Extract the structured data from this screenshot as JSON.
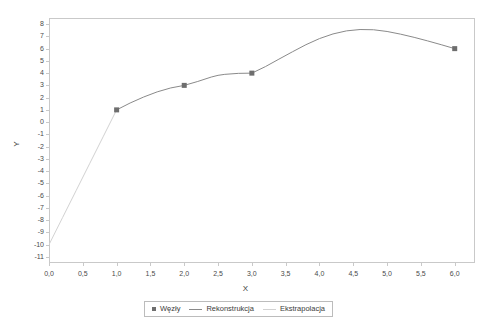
{
  "chart_data": {
    "type": "line",
    "title": "",
    "xlabel": "X",
    "ylabel": "Y",
    "xlim": [
      0.0,
      6.3
    ],
    "ylim": [
      -11.5,
      8.5
    ],
    "grid": false,
    "legend_position": "bottom",
    "xticks": [
      "0,0",
      "0,5",
      "1,0",
      "1,5",
      "2,0",
      "2,5",
      "3,0",
      "3,5",
      "4,0",
      "4,5",
      "5,0",
      "5,5",
      "6,0"
    ],
    "xtick_values": [
      0.0,
      0.5,
      1.0,
      1.5,
      2.0,
      2.5,
      3.0,
      3.5,
      4.0,
      4.5,
      5.0,
      5.5,
      6.0
    ],
    "yticks": [
      "8",
      "7",
      "6",
      "5",
      "4",
      "3",
      "2",
      "1",
      "0",
      "-1",
      "-2",
      "-3",
      "-4",
      "-5",
      "-6",
      "-7",
      "-8",
      "-9",
      "-10",
      "-11"
    ],
    "ytick_values": [
      8,
      7,
      6,
      5,
      4,
      3,
      2,
      1,
      0,
      -1,
      -2,
      -3,
      -4,
      -5,
      -6,
      -7,
      -8,
      -9,
      -10,
      -11
    ],
    "series": [
      {
        "name": "Węzły",
        "type": "scatter",
        "marker": "square",
        "color": "#6e6e6e",
        "x": [
          1.0,
          2.0,
          3.0,
          6.0
        ],
        "y": [
          1.0,
          3.0,
          4.0,
          6.0
        ]
      },
      {
        "name": "Rekonstrukcja",
        "type": "line",
        "color": "#8a8a8a",
        "x": [
          1.0,
          1.2,
          1.4,
          1.6,
          1.8,
          2.0,
          2.2,
          2.4,
          2.5,
          2.6,
          2.8,
          3.0,
          3.2,
          3.4,
          3.6,
          3.8,
          4.0,
          4.2,
          4.4,
          4.6,
          4.8,
          5.0,
          5.2,
          5.4,
          5.6,
          5.8,
          6.0
        ],
        "y": [
          1.0,
          1.56,
          2.05,
          2.47,
          2.79,
          3.0,
          3.32,
          3.68,
          3.82,
          3.9,
          3.98,
          4.0,
          4.53,
          5.14,
          5.74,
          6.32,
          6.82,
          7.2,
          7.45,
          7.56,
          7.54,
          7.4,
          7.18,
          6.92,
          6.63,
          6.32,
          6.0
        ]
      },
      {
        "name": "Ekstrapolacja",
        "type": "line",
        "color": "#d2d2d2",
        "x": [
          0.0,
          0.2,
          0.4,
          0.6,
          0.8,
          1.0
        ],
        "y": [
          -10.0,
          -7.8,
          -5.6,
          -3.4,
          -1.2,
          1.0
        ]
      }
    ]
  },
  "legend": {
    "items": [
      {
        "label": "Węzły",
        "swatch": "marker"
      },
      {
        "label": "Rekonstrukcja",
        "swatch": "line"
      },
      {
        "label": "Ekstrapolacja",
        "swatch": "line-light"
      }
    ]
  },
  "colors": {
    "marker": "#6e6e6e",
    "reconstruction_line": "#8a8a8a",
    "extrapolation_line": "#d2d2d2",
    "frame": "#c9c9c9",
    "text": "#3c3c3c",
    "background": "#ffffff"
  }
}
